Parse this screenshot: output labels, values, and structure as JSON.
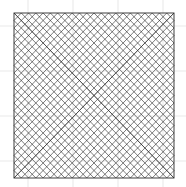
{
  "canvas": {
    "width": 186,
    "height": 187,
    "background_color": "#ffffff",
    "title": "Curve stitching square envelope figure"
  },
  "background_grid": {
    "visible": true,
    "color": "#f0f0f0",
    "line_width": 1.6,
    "spacing": 45,
    "x_positions": [
      28,
      73,
      118,
      163
    ],
    "y_positions": [
      26,
      71,
      116,
      161
    ]
  },
  "figure": {
    "name": "string-art-square",
    "type": "curve-stitching",
    "stroke_color": "#2b2b2b",
    "line_width": 0.62,
    "frame": {
      "left": 14,
      "top": 13,
      "right": 174,
      "bottom": 178
    },
    "divisions_per_side": 22,
    "corner_crossings": [
      {
        "name": "top-center-crossing",
        "x": 94,
        "y": 23
      },
      {
        "name": "left-center-crossing",
        "x": 22,
        "y": 96
      },
      {
        "name": "right-center-crossing",
        "x": 166,
        "y": 96
      },
      {
        "name": "bottom-center-crossing",
        "x": 94,
        "y": 169
      }
    ],
    "envelope_curves": [
      {
        "name": "top-left-envelope",
        "from_edge": "left",
        "to_edge": "top"
      },
      {
        "name": "top-right-envelope",
        "from_edge": "top",
        "to_edge": "right"
      },
      {
        "name": "bottom-right-envelope",
        "from_edge": "right",
        "to_edge": "bottom"
      },
      {
        "name": "bottom-left-envelope",
        "from_edge": "bottom",
        "to_edge": "left"
      }
    ],
    "border": {
      "visible": true,
      "color": "#2b2b2b",
      "line_width": 0.9
    }
  }
}
